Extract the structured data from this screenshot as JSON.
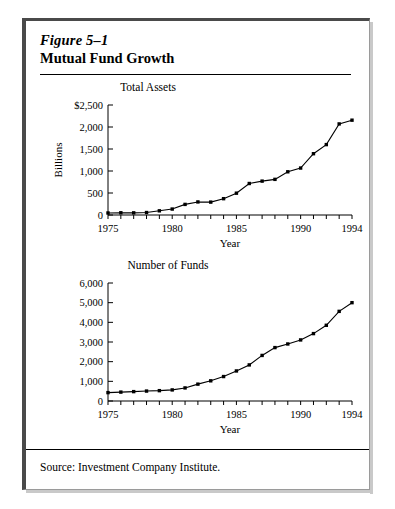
{
  "figure": {
    "number": "Figure 5–1",
    "title": "Mutual Fund Growth",
    "source": "Source:  Investment Company Institute."
  },
  "colors": {
    "ink": "#000000",
    "frame_dark": "#4a4a4a",
    "frame_light": "#9a9a9a",
    "shadow": "#c9c9c9",
    "page": "#ffffff"
  },
  "chart_data": [
    {
      "type": "line",
      "title": "Total Assets",
      "xlabel": "Year",
      "ylabel": "Billions",
      "x": [
        1975,
        1976,
        1977,
        1978,
        1979,
        1980,
        1981,
        1982,
        1983,
        1984,
        1985,
        1986,
        1987,
        1988,
        1989,
        1990,
        1991,
        1992,
        1993,
        1994
      ],
      "values": [
        46,
        51,
        49,
        56,
        95,
        135,
        241,
        297,
        293,
        371,
        496,
        716,
        770,
        810,
        982,
        1067,
        1393,
        1600,
        2070,
        2155
      ],
      "xlim": [
        1975,
        1994
      ],
      "ylim": [
        0,
        2500
      ],
      "ytick_values": [
        0,
        500,
        1000,
        1500,
        2000,
        2500
      ],
      "ytick_labels": [
        "0",
        "500",
        "1,000",
        "1,500",
        "2,000",
        "$2,500"
      ],
      "xtick_values": [
        1975,
        1980,
        1985,
        1990,
        1994
      ],
      "xtick_labels": [
        "1975",
        "1980",
        "1985",
        "1990",
        "1994"
      ],
      "minor_xticks_every": 1,
      "grid": false,
      "legend": "none",
      "markers": "square"
    },
    {
      "type": "line",
      "title": "Number of Funds",
      "xlabel": "Year",
      "ylabel": "",
      "x": [
        1975,
        1976,
        1977,
        1978,
        1979,
        1980,
        1981,
        1982,
        1983,
        1984,
        1985,
        1986,
        1987,
        1988,
        1989,
        1990,
        1991,
        1992,
        1993,
        1994
      ],
      "values": [
        426,
        452,
        477,
        505,
        526,
        564,
        665,
        857,
        1026,
        1243,
        1528,
        1835,
        2317,
        2715,
        2900,
        3105,
        3427,
        3850,
        4558,
        5000
      ],
      "xlim": [
        1975,
        1994
      ],
      "ylim": [
        0,
        6000
      ],
      "ytick_values": [
        0,
        1000,
        2000,
        3000,
        4000,
        5000,
        6000
      ],
      "ytick_labels": [
        "0",
        "1,000",
        "2,000",
        "3,000",
        "4,000",
        "5,000",
        "6,000"
      ],
      "xtick_values": [
        1975,
        1980,
        1985,
        1990,
        1994
      ],
      "xtick_labels": [
        "1975",
        "1980",
        "1985",
        "1990",
        "1994"
      ],
      "minor_xticks_every": 1,
      "grid": false,
      "legend": "none",
      "markers": "square"
    }
  ]
}
